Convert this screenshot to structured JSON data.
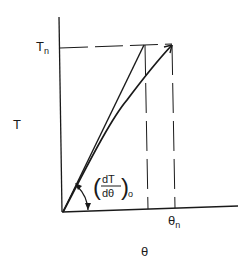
{
  "diagram": {
    "type": "line-graph-sketch",
    "axes": {
      "y_label": "T",
      "x_label": "θ",
      "y_marker": {
        "main": "T",
        "sub": "n"
      },
      "x_marker": {
        "main": "θ",
        "sub": "n"
      }
    },
    "annotations": {
      "slope_label": {
        "numerator": "dT",
        "denominator": "dθ",
        "subscript": "o"
      }
    },
    "elements": [
      "curve from origin to (θn, Tn)",
      "initial tangent line from origin reaching Tn",
      "horizontal dashed line at Tn",
      "vertical dashed lines down to θ axis",
      "angle arc with arrowheads at origin"
    ],
    "colors": {
      "ink": "#1a1a1a",
      "background": "#ffffff"
    }
  }
}
